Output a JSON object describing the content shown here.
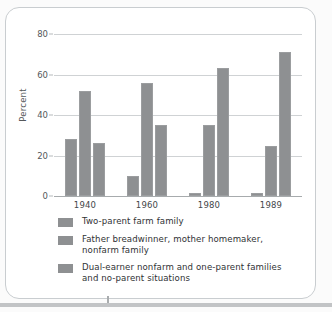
{
  "chart_data": {
    "type": "bar",
    "title": "",
    "xlabel": "",
    "ylabel": "Percent",
    "ylim": [
      0,
      80
    ],
    "yticks": [
      0,
      20,
      40,
      60,
      80
    ],
    "grid": true,
    "legend_position": "bottom-left",
    "categories": [
      "1940",
      "1960",
      "1980",
      "1989"
    ],
    "series": [
      {
        "name": "Two-parent farm family",
        "name_line1": "Two-parent farm family",
        "name_line2": "",
        "color": "#8e9092",
        "values": [
          28,
          10,
          1.5,
          1.5
        ]
      },
      {
        "name": "Father breadwinner, mother homemaker, nonfarm family",
        "name_line1": "Father breadwinner, mother homemaker,",
        "name_line2": "nonfarm family",
        "color": "#8e9092",
        "values": [
          52,
          56,
          35,
          24.5
        ]
      },
      {
        "name": "Dual-earner nonfarm and one-parent families and no-parent situations",
        "name_line1": "Dual-earner nonfarm and one-parent families",
        "name_line2": "and no-parent situations",
        "color": "#8e9092",
        "values": [
          26,
          35,
          63,
          71
        ]
      }
    ]
  },
  "colors": {
    "bar": "#8e9092",
    "gridline": "#cfd2d4",
    "axis": "#a7abad",
    "text": "#2f3234",
    "tick_text": "#55585a",
    "card_border": "#c9cdd0",
    "page_background": "#fbfbfb"
  }
}
